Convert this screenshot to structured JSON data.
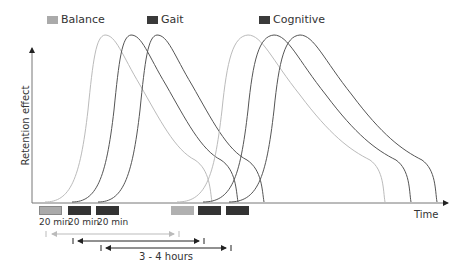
{
  "legend": [
    {
      "label": "Balance",
      "color": "#aaaaaa"
    },
    {
      "label": "Gait",
      "color": "#3a3a3a"
    },
    {
      "label": "Cognitive",
      "color": "#3a3a3a"
    }
  ],
  "axes": {
    "ylabel": "Retention effect",
    "xlabel": "Time"
  },
  "sessions": {
    "duration_labels": [
      "20 min",
      "20 min",
      "20 min"
    ]
  },
  "interval_label": "3 - 4 hours",
  "colors": {
    "balance": "#b5b5b5",
    "gait": "#444444",
    "cognitive": "#555555",
    "axis": "#888888"
  }
}
